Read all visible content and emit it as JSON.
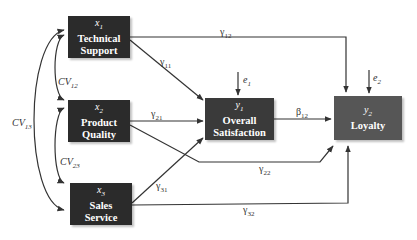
{
  "colors": {
    "exogenous_box": "#2b2b2b",
    "y1_box": "#3a3a3a",
    "y2_box": "#565656",
    "line": "#333333",
    "box_text": "#ffffff"
  },
  "nodes": {
    "x1": {
      "var": "x",
      "sub": "1",
      "line1": "Technical",
      "line2": "Support"
    },
    "x2": {
      "var": "x",
      "sub": "2",
      "line1": "Product",
      "line2": "Quality"
    },
    "x3": {
      "var": "x",
      "sub": "3",
      "line1": "Sales",
      "line2": "Service"
    },
    "y1": {
      "var": "y",
      "sub": "1",
      "line1": "Overall",
      "line2": "Satisfaction"
    },
    "y2": {
      "var": "y",
      "sub": "2",
      "line1": "Loyalty",
      "line2": ""
    }
  },
  "paths": {
    "g11": {
      "sym": "γ",
      "sub": "11"
    },
    "g12": {
      "sym": "γ",
      "sub": "12"
    },
    "g21": {
      "sym": "γ",
      "sub": "21"
    },
    "g22": {
      "sym": "γ",
      "sub": "22"
    },
    "g31": {
      "sym": "γ",
      "sub": "31"
    },
    "g32": {
      "sym": "γ",
      "sub": "32"
    },
    "b12": {
      "sym": "β",
      "sub": "12"
    }
  },
  "errors": {
    "e1": {
      "sym": "e",
      "sub": "1"
    },
    "e2": {
      "sym": "e",
      "sub": "2"
    }
  },
  "covariances": {
    "cv12": {
      "sym": "CV",
      "sub": "12"
    },
    "cv13": {
      "sym": "CV",
      "sub": "13"
    },
    "cv23": {
      "sym": "CV",
      "sub": "23"
    }
  }
}
